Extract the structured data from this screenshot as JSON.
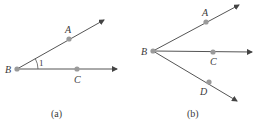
{
  "figure_a": {
    "caption": "(a)",
    "points": {
      "B": "B",
      "A": "A",
      "C": "C"
    },
    "angle_label": "1"
  },
  "figure_b": {
    "caption": "(b)",
    "points": {
      "B": "B",
      "A": "A",
      "C": "C",
      "D": "D"
    }
  },
  "colors": {
    "line": "#555555",
    "dot": "#9a9a9a",
    "text": "#3a3a3a"
  }
}
